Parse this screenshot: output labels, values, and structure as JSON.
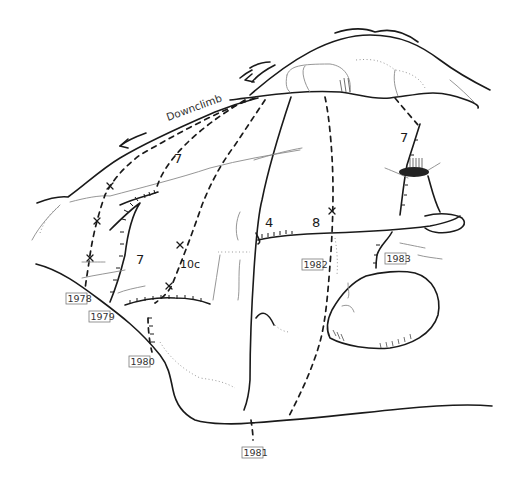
{
  "annotation": {
    "downclimb": "Downclimb"
  },
  "grades": [
    {
      "id": "left-7-upper",
      "text": "7"
    },
    {
      "id": "left-7-lower",
      "text": "7"
    },
    {
      "id": "10c",
      "text": "10c"
    },
    {
      "id": "4",
      "text": "4"
    },
    {
      "id": "8",
      "text": "8"
    },
    {
      "id": "right-7",
      "text": "7"
    }
  ],
  "route_labels": [
    {
      "text": "1978"
    },
    {
      "text": "1979"
    },
    {
      "text": "1980"
    },
    {
      "text": "1981"
    },
    {
      "text": "1982"
    },
    {
      "text": "1983"
    }
  ],
  "colors": {
    "ink": "#1a1a1a",
    "pencil": "#8a8a8a",
    "background": "#ffffff"
  }
}
